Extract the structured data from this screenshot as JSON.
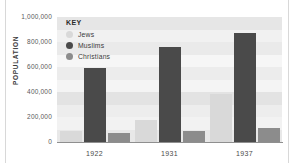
{
  "chart_data": {
    "type": "bar",
    "title": "",
    "xlabel": "",
    "ylabel": "POPULATION",
    "categories": [
      "1922",
      "1931",
      "1937"
    ],
    "ylim": [
      0,
      1000000
    ],
    "ytick_labels": [
      "0",
      "200,000",
      "400,000",
      "600,000",
      "800,000",
      "1,000,000"
    ],
    "ytick_values": [
      0,
      200000,
      400000,
      600000,
      800000,
      1000000
    ],
    "grid": false,
    "legend_position": "top-left",
    "legend_title": "KEY",
    "series": [
      {
        "name": "Jews",
        "color": "#d9d9d9",
        "values": [
          85000,
          175000,
          385000
        ]
      },
      {
        "name": "Muslims",
        "color": "#4a4a4a",
        "values": [
          590000,
          760000,
          875000
        ]
      },
      {
        "name": "Christians",
        "color": "#8c8c8c",
        "values": [
          75000,
          90000,
          115000
        ]
      }
    ],
    "bands": [
      {
        "from": 0,
        "to": 100000,
        "color": "#e8e8e8"
      },
      {
        "from": 100000,
        "to": 200000,
        "color": "#f2f2f2"
      },
      {
        "from": 200000,
        "to": 300000,
        "color": "#ededed"
      },
      {
        "from": 300000,
        "to": 400000,
        "color": "#e3e3e3"
      },
      {
        "from": 400000,
        "to": 500000,
        "color": "#f4f4f4"
      },
      {
        "from": 500000,
        "to": 600000,
        "color": "#ececec"
      },
      {
        "from": 600000,
        "to": 700000,
        "color": "#f6f6f6"
      },
      {
        "from": 700000,
        "to": 800000,
        "color": "#eaeaea"
      },
      {
        "from": 800000,
        "to": 900000,
        "color": "#f1f1f1"
      },
      {
        "from": 900000,
        "to": 1000000,
        "color": "#e6e6e6"
      }
    ]
  }
}
